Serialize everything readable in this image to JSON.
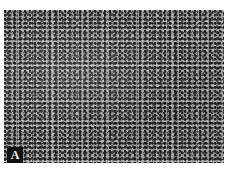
{
  "figure": {
    "panel_label": "A",
    "colors": {
      "background": "#ffffff",
      "label_box": "#111111",
      "label_text": "#f2f2f2"
    }
  }
}
